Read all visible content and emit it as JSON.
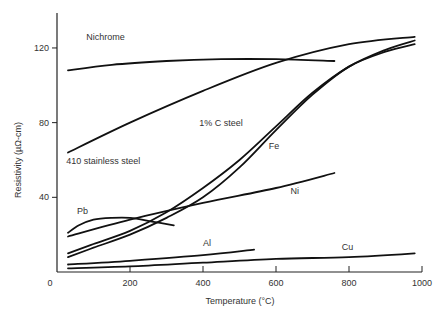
{
  "chart_data": {
    "type": "line",
    "title": "",
    "xlabel": "Temperature (°C)",
    "ylabel": "Resistivity (µΩ-cm)",
    "xlim": [
      0,
      1000
    ],
    "ylim": [
      0,
      140
    ],
    "xticks": [
      0,
      200,
      400,
      600,
      800,
      1000
    ],
    "yticks": [
      40,
      80,
      120
    ],
    "grid": false,
    "legend": "inline labels",
    "series": [
      {
        "name": "Nichrome",
        "x": [
          30,
          150,
          300,
          450,
          600,
          760
        ],
        "values": [
          108,
          111,
          113,
          114,
          114,
          113
        ]
      },
      {
        "name": "410 stainless steel",
        "x": [
          30,
          200,
          400,
          600,
          800,
          980
        ],
        "values": [
          64,
          80,
          97,
          112,
          122,
          126
        ]
      },
      {
        "name": "1% C steel",
        "x": [
          30,
          100,
          200,
          300,
          400,
          500,
          600,
          700,
          800,
          900,
          980
        ],
        "values": [
          10,
          15,
          22,
          32,
          45,
          60,
          78,
          96,
          110,
          119,
          124
        ]
      },
      {
        "name": "Fe",
        "x": [
          30,
          100,
          200,
          300,
          400,
          500,
          600,
          700,
          800,
          900,
          980
        ],
        "values": [
          8,
          13,
          20,
          29,
          40,
          56,
          76,
          95,
          110,
          118,
          122
        ]
      },
      {
        "name": "Ni",
        "x": [
          30,
          200,
          400,
          600,
          760
        ],
        "values": [
          19,
          28,
          37,
          45,
          53
        ]
      },
      {
        "name": "Pb",
        "x": [
          30,
          60,
          100,
          150,
          200,
          260,
          320
        ],
        "values": [
          21,
          25,
          28,
          29,
          29,
          27,
          25
        ]
      },
      {
        "name": "Al",
        "x": [
          30,
          200,
          400,
          540
        ],
        "values": [
          4,
          6,
          9,
          12
        ]
      },
      {
        "name": "Cu",
        "x": [
          30,
          200,
          400,
          600,
          800,
          980
        ],
        "values": [
          2,
          3,
          5,
          7,
          8,
          10
        ]
      }
    ],
    "labels": [
      {
        "text": "Nichrome",
        "x": 80,
        "y": 124
      },
      {
        "text": "410 stainless steel",
        "x": 25,
        "y": 58
      },
      {
        "text": "1% C steel",
        "x": 390,
        "y": 78
      },
      {
        "text": "Fe",
        "x": 580,
        "y": 66
      },
      {
        "text": "Ni",
        "x": 640,
        "y": 42
      },
      {
        "text": "Pb",
        "x": 55,
        "y": 31
      },
      {
        "text": "Al",
        "x": 400,
        "y": 14
      },
      {
        "text": "Cu",
        "x": 780,
        "y": 12
      }
    ]
  },
  "axes": {
    "x_title": "Temperature (°C)",
    "y_title": "Resistivity (µΩ-cm)",
    "x_tick_labels": [
      "0",
      "200",
      "400",
      "600",
      "800",
      "1000"
    ],
    "y_tick_labels": [
      "40",
      "80",
      "120"
    ]
  }
}
